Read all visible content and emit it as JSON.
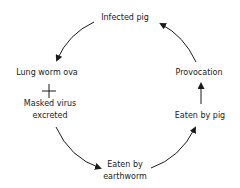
{
  "diagram": {
    "type": "cycle",
    "nodes": {
      "infected_pig": "Infected pig",
      "lung_worm_ova": "Lung worm ova",
      "plus": "+",
      "masked_virus_line1": "Masked virus",
      "masked_virus_line2": "excreted",
      "eaten_by_earthworm_line1": "Eaten by",
      "eaten_by_earthworm_line2": "earthworm",
      "eaten_by_pig": "Eaten by pig",
      "provocation": "Provocation"
    },
    "edges": [
      {
        "from": "Infected pig",
        "to": "Lung worm ova + Masked virus excreted"
      },
      {
        "from": "Masked virus excreted",
        "to": "Eaten by earthworm"
      },
      {
        "from": "Eaten by earthworm",
        "to": "Eaten by pig"
      },
      {
        "from": "Eaten by pig",
        "to": "Provocation"
      },
      {
        "from": "Provocation",
        "to": "Infected pig"
      }
    ]
  }
}
